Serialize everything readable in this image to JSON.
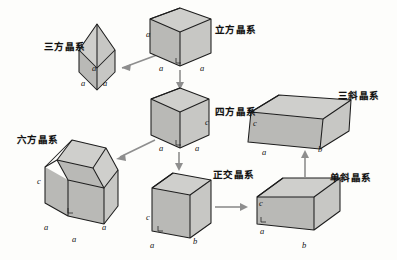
{
  "figure": {
    "background_color": "#fdfdfb",
    "shape_fill_top": "#cfcfcc",
    "shape_fill_left": "#b9b9b6",
    "shape_fill_right": "#c7c7c4",
    "edge_color": "#1d1d1d",
    "arrow_color": "#8e8e8e"
  },
  "systems": [
    {
      "id": "trigonal",
      "label": "三方晶系",
      "shape": "rhombohedron",
      "edge_labels": [
        "a",
        "a",
        "a"
      ]
    },
    {
      "id": "cubic",
      "label": "立方晶系",
      "shape": "cube",
      "edge_labels": [
        "a",
        "a",
        "a"
      ]
    },
    {
      "id": "tetragonal",
      "label": "四方晶系",
      "shape": "square-prism",
      "edge_labels": [
        "a",
        "a",
        "c"
      ]
    },
    {
      "id": "hexagonal",
      "label": "六方晶系",
      "shape": "hexagonal-prism",
      "edge_labels": [
        "a",
        "a",
        "a",
        "c"
      ]
    },
    {
      "id": "orthorhombic",
      "label": "正交晶系",
      "shape": "rectangular-prism",
      "edge_labels": [
        "a",
        "b",
        "c"
      ]
    },
    {
      "id": "monoclinic",
      "label": "单斜晶系",
      "shape": "oblique-prism",
      "edge_labels": [
        "a",
        "b",
        "c"
      ]
    },
    {
      "id": "triclinic",
      "label": "三斜晶系",
      "shape": "triclinic-prism",
      "edge_labels": [
        "a",
        "b",
        "c"
      ]
    }
  ],
  "arrows": [
    {
      "id": "cubic-to-trigonal",
      "from": "cubic",
      "to": "trigonal"
    },
    {
      "id": "cubic-to-tetragonal",
      "from": "cubic",
      "to": "tetragonal"
    },
    {
      "id": "tetragonal-to-hexagonal",
      "from": "tetragonal",
      "to": "hexagonal"
    },
    {
      "id": "tetragonal-to-orthorhombic",
      "from": "tetragonal",
      "to": "orthorhombic"
    },
    {
      "id": "orthorhombic-to-monoclinic",
      "from": "orthorhombic",
      "to": "monoclinic"
    },
    {
      "id": "monoclinic-to-triclinic",
      "from": "monoclinic",
      "to": "triclinic"
    }
  ],
  "labels": {
    "trigonal": {
      "text": "三方晶系",
      "x": 44,
      "y": 39
    },
    "cubic": {
      "text": "立方晶系",
      "x": 215,
      "y": 22
    },
    "tetragonal": {
      "text": "四方晶系",
      "x": 215,
      "y": 104
    },
    "hexagonal": {
      "text": "六方晶系",
      "x": 17,
      "y": 132
    },
    "orthorhombic": {
      "text": "正交晶系",
      "x": 213,
      "y": 167
    },
    "monoclinic": {
      "text": "单斜晶系",
      "x": 330,
      "y": 170
    },
    "triclinic": {
      "text": "三斜晶系",
      "x": 338,
      "y": 88
    }
  },
  "axis_annotations": [
    {
      "id": "cubic-a-left",
      "text": "a",
      "x": 146,
      "y": 29
    },
    {
      "id": "cubic-a-bottom-left",
      "text": "a",
      "x": 159,
      "y": 63
    },
    {
      "id": "cubic-a-bottom-right",
      "text": "a",
      "x": 200,
      "y": 63
    },
    {
      "id": "trigonal-a-mid",
      "text": "a",
      "x": 92,
      "y": 63
    },
    {
      "id": "trigonal-a-left",
      "text": "a",
      "x": 81,
      "y": 78
    },
    {
      "id": "trigonal-a-right",
      "text": "a",
      "x": 103,
      "y": 78
    },
    {
      "id": "tetragonal-a-left",
      "text": "a",
      "x": 159,
      "y": 143
    },
    {
      "id": "tetragonal-a-right",
      "text": "a",
      "x": 195,
      "y": 143
    },
    {
      "id": "tetragonal-c",
      "text": "c",
      "x": 205,
      "y": 117
    },
    {
      "id": "hexagonal-c",
      "text": "c",
      "x": 37,
      "y": 176
    },
    {
      "id": "hexagonal-a-left",
      "text": "a",
      "x": 44,
      "y": 222
    },
    {
      "id": "hexagonal-a-right",
      "text": "a",
      "x": 102,
      "y": 222
    },
    {
      "id": "hexagonal-a-bottom",
      "text": "a",
      "x": 72,
      "y": 234
    },
    {
      "id": "orthorhombic-c",
      "text": "c",
      "x": 146,
      "y": 212
    },
    {
      "id": "orthorhombic-a",
      "text": "a",
      "x": 150,
      "y": 240
    },
    {
      "id": "orthorhombic-b",
      "text": "b",
      "x": 193,
      "y": 236
    },
    {
      "id": "monoclinic-c",
      "text": "c",
      "x": 259,
      "y": 198
    },
    {
      "id": "monoclinic-a",
      "text": "a",
      "x": 260,
      "y": 226
    },
    {
      "id": "monoclinic-b",
      "text": "b",
      "x": 302,
      "y": 240
    },
    {
      "id": "triclinic-c",
      "text": "c",
      "x": 253,
      "y": 118
    },
    {
      "id": "triclinic-a",
      "text": "a",
      "x": 262,
      "y": 147
    },
    {
      "id": "triclinic-b",
      "text": "b",
      "x": 318,
      "y": 144
    }
  ]
}
